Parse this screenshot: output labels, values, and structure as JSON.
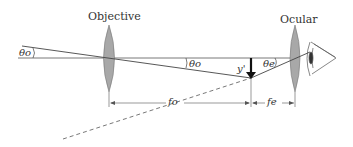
{
  "diagram": {
    "type": "optics-ray-diagram",
    "labels": {
      "objective": "Objective",
      "ocular": "Ocular",
      "theta_o_left": "θo",
      "theta_o_mid": "θo",
      "theta_e": "θe",
      "image_height": "y'",
      "focal_objective": "fo",
      "focal_ocular": "fe"
    },
    "colors": {
      "line": "#444444",
      "lens_fill": "#a8a8a8",
      "lens_stroke": "#777777",
      "background": "#ffffff"
    }
  }
}
